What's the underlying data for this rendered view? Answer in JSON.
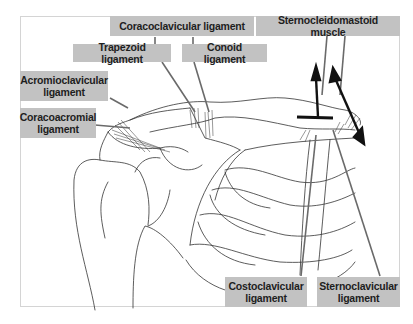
{
  "figure": {
    "labels": {
      "coracoclavicular": "Coracoclavicular ligament",
      "trapezoid": "Trapezoid ligament",
      "conoid": "Conoid ligament",
      "sternocleidomastoid": "Sternocleidomastoid muscle",
      "acromioclavicular": "Acromioclavicular\nligament",
      "coracoacromial": "Coracoacromial\nligament",
      "costoclavicular": "Costoclavicular\nligament",
      "sternoclavicular": "Sternoclavicular\nligament"
    },
    "colors": {
      "label_bg": "#c2c2c2",
      "leader_line": "#6a6a6a",
      "drawing_line": "#333333",
      "arrow": "#111111"
    }
  }
}
